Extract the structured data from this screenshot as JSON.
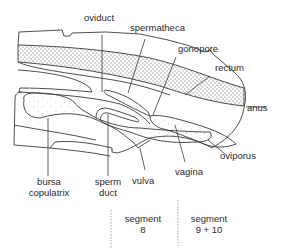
{
  "diagram": {
    "colors": {
      "line": "#3a3a3a",
      "stipple": "#555555",
      "background": "#ffffff",
      "text": "#2a2a2a",
      "divider": "#888888"
    },
    "labels": {
      "oviduct": "oviduct",
      "spermatheca": "spermatheca",
      "gonopore": "gonopore",
      "rectum": "rectum",
      "anus": "anus",
      "oviporus": "oviporus",
      "vagina": "vagina",
      "vulva": "vulva",
      "bursa_line1": "bursa",
      "bursa_line2": "copulatrix",
      "sperm_line1": "sperm",
      "sperm_line2": "duct"
    },
    "segments": [
      {
        "line1": "segment",
        "line2": "8"
      },
      {
        "line1": "segment",
        "line2": "9 + 10"
      }
    ]
  }
}
